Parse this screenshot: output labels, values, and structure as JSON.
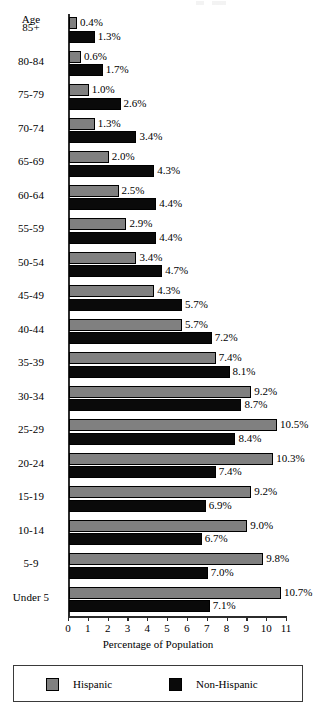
{
  "chart_data": {
    "type": "bar",
    "orientation": "horizontal",
    "title": "",
    "xlabel": "Percentage of Population",
    "ylabel": "Age",
    "xlim": [
      0,
      11
    ],
    "xticks": [
      0,
      1,
      2,
      3,
      4,
      5,
      6,
      7,
      8,
      9,
      10,
      11
    ],
    "xtick_labels": [
      "0",
      "1",
      "2",
      "3",
      "4",
      "5",
      "6",
      "7",
      "8",
      "9",
      "10",
      "11"
    ],
    "grid": false,
    "legend_position": "bottom",
    "value_suffix": "%",
    "categories": [
      "85+",
      "80-84",
      "75-79",
      "70-74",
      "65-69",
      "60-64",
      "55-59",
      "50-54",
      "45-49",
      "40-44",
      "35-39",
      "30-34",
      "25-29",
      "20-24",
      "15-19",
      "10-14",
      "5-9",
      "Under 5"
    ],
    "series": [
      {
        "name": "Hispanic",
        "color": "#808080",
        "values": [
          0.4,
          0.6,
          1.0,
          1.3,
          2.0,
          2.5,
          2.9,
          3.4,
          4.3,
          5.7,
          7.4,
          9.2,
          10.5,
          10.3,
          9.2,
          9.0,
          9.8,
          10.7
        ],
        "labels": [
          "0.4%",
          "0.6%",
          "1.0%",
          "1.3%",
          "2.0%",
          "2.5%",
          "2.9%",
          "3.4%",
          "4.3%",
          "5.7%",
          "7.4%",
          "9.2%",
          "10.5%",
          "10.3%",
          "9.2%",
          "9.0%",
          "9.8%",
          "10.7%"
        ]
      },
      {
        "name": "Non-Hispanic",
        "color": "#0a0a0a",
        "values": [
          1.3,
          1.7,
          2.6,
          3.4,
          4.3,
          4.4,
          4.4,
          4.7,
          5.7,
          7.2,
          8.1,
          8.7,
          8.4,
          7.4,
          6.9,
          6.7,
          7.0,
          7.1
        ],
        "labels": [
          "1.3%",
          "1.7%",
          "2.6%",
          "3.4%",
          "4.3%",
          "4.4%",
          "4.4%",
          "4.7%",
          "5.7%",
          "7.2%",
          "8.1%",
          "8.7%",
          "8.4%",
          "7.4%",
          "6.9%",
          "6.7%",
          "7.0%",
          "7.1%"
        ]
      }
    ]
  },
  "axis": {
    "y_header": "Age",
    "x_title": "Percentage of Population"
  },
  "legend": {
    "entries": [
      {
        "label": "Hispanic",
        "color": "#808080"
      },
      {
        "label": "Non-Hispanic",
        "color": "#0a0a0a"
      }
    ]
  }
}
